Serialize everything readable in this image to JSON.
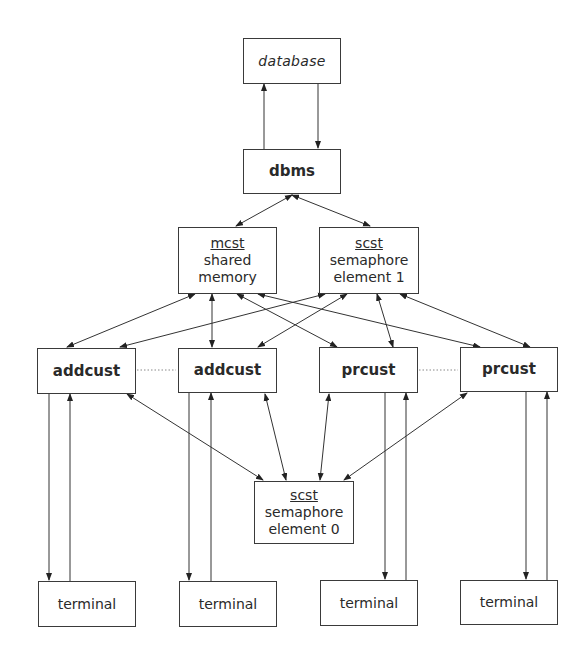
{
  "nodes": {
    "database": {
      "label": "database"
    },
    "dbms": {
      "label": "dbms"
    },
    "mcst": {
      "title": "mcst",
      "line1": "shared",
      "line2": "memory"
    },
    "scst1": {
      "title": "scst",
      "line1": "semaphore",
      "line2": "element 1"
    },
    "addcust1": {
      "label": "addcust"
    },
    "addcust2": {
      "label": "addcust"
    },
    "prcust1": {
      "label": "prcust"
    },
    "prcust2": {
      "label": "prcust"
    },
    "scst0": {
      "title": "scst",
      "line1": "semaphore",
      "line2": "element 0"
    },
    "terminal1": {
      "label": "terminal"
    },
    "terminal2": {
      "label": "terminal"
    },
    "terminal3": {
      "label": "terminal"
    },
    "terminal4": {
      "label": "terminal"
    }
  },
  "edges": [
    {
      "from": "dbms",
      "to": "database",
      "type": "one-way"
    },
    {
      "from": "database",
      "to": "dbms",
      "type": "one-way"
    },
    {
      "from": "dbms",
      "to": "mcst",
      "type": "two-way"
    },
    {
      "from": "dbms",
      "to": "scst1",
      "type": "two-way"
    },
    {
      "from": "mcst",
      "to": "addcust1",
      "type": "two-way"
    },
    {
      "from": "mcst",
      "to": "addcust2",
      "type": "two-way"
    },
    {
      "from": "mcst",
      "to": "prcust1",
      "type": "two-way"
    },
    {
      "from": "mcst",
      "to": "prcust2",
      "type": "two-way"
    },
    {
      "from": "scst1",
      "to": "addcust1",
      "type": "two-way"
    },
    {
      "from": "scst1",
      "to": "addcust2",
      "type": "two-way"
    },
    {
      "from": "scst1",
      "to": "prcust1",
      "type": "two-way"
    },
    {
      "from": "scst1",
      "to": "prcust2",
      "type": "two-way"
    },
    {
      "from": "addcust1",
      "to": "scst0",
      "type": "two-way"
    },
    {
      "from": "addcust2",
      "to": "scst0",
      "type": "two-way"
    },
    {
      "from": "prcust1",
      "to": "scst0",
      "type": "two-way"
    },
    {
      "from": "prcust2",
      "to": "scst0",
      "type": "two-way"
    },
    {
      "from": "addcust1",
      "to": "terminal1",
      "type": "one-way"
    },
    {
      "from": "terminal1",
      "to": "addcust1",
      "type": "one-way"
    },
    {
      "from": "addcust2",
      "to": "terminal2",
      "type": "one-way"
    },
    {
      "from": "terminal2",
      "to": "addcust2",
      "type": "one-way"
    },
    {
      "from": "prcust1",
      "to": "terminal3",
      "type": "one-way"
    },
    {
      "from": "terminal3",
      "to": "prcust1",
      "type": "one-way"
    },
    {
      "from": "prcust2",
      "to": "terminal4",
      "type": "one-way"
    },
    {
      "from": "terminal4",
      "to": "prcust2",
      "type": "one-way"
    },
    {
      "from": "addcust1",
      "to": "addcust2",
      "type": "dotted"
    },
    {
      "from": "prcust1",
      "to": "prcust2",
      "type": "dotted"
    }
  ]
}
